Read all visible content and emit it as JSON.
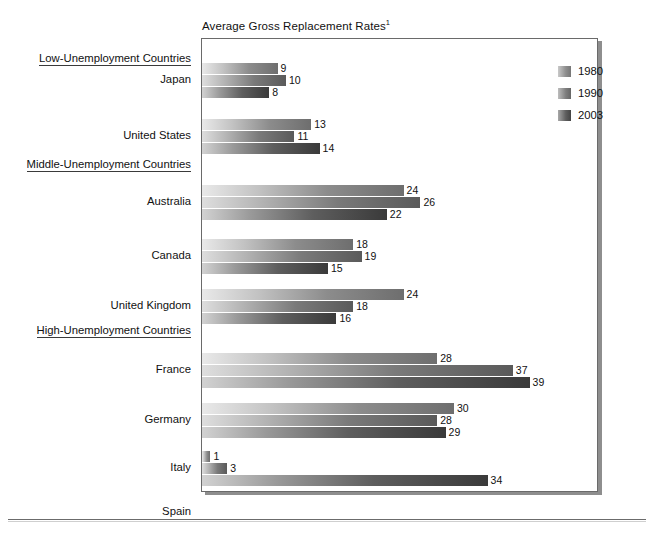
{
  "chart_title": "Average Gross Replacement Rates",
  "chart_title_superscript": "1",
  "legend": {
    "items": [
      {
        "label": "1980",
        "swatch": "series-swatch-1980"
      },
      {
        "label": "1990",
        "swatch": "series-swatch-1990"
      },
      {
        "label": "2003",
        "swatch": "series-swatch-2003"
      }
    ]
  },
  "groups": [
    {
      "label": "Low-Unemployment Countries"
    },
    {
      "label": "Middle-Unemployment Countries"
    },
    {
      "label": "High-Unemployment Countries"
    }
  ],
  "chart_data": {
    "type": "bar",
    "orientation": "horizontal",
    "xlabel": "",
    "ylabel": "",
    "grid": false,
    "legend_position": "top-right",
    "series": [
      {
        "name": "1980",
        "values": [
          9,
          13,
          24,
          18,
          24,
          28,
          30,
          1,
          25
        ]
      },
      {
        "name": "1990",
        "values": [
          10,
          11,
          26,
          19,
          18,
          37,
          28,
          3,
          34
        ]
      },
      {
        "name": "2003",
        "values": [
          8,
          14,
          22,
          15,
          16,
          39,
          29,
          34,
          36
        ]
      }
    ],
    "categories": [
      "Japan",
      "United States",
      "Australia",
      "Canada",
      "United Kingdom",
      "France",
      "Germany",
      "Italy",
      "Spain"
    ],
    "category_groups": [
      {
        "label": "Low-Unemployment Countries",
        "categories": [
          "Japan",
          "United States"
        ]
      },
      {
        "label": "Middle-Unemployment Countries",
        "categories": [
          "Australia",
          "Canada",
          "United Kingdom"
        ]
      },
      {
        "label": "High-Unemployment Countries",
        "categories": [
          "France",
          "Germany",
          "Italy",
          "Spain"
        ]
      }
    ],
    "xlim": [
      0,
      42
    ],
    "rows": [
      {
        "category": "Japan",
        "group": "Low-Unemployment Countries",
        "values": {
          "1980": 9,
          "1990": 10,
          "2003": 8
        }
      },
      {
        "category": "United States",
        "group": "Low-Unemployment Countries",
        "values": {
          "1980": 13,
          "1990": 11,
          "2003": 14
        }
      },
      {
        "category": "Australia",
        "group": "Middle-Unemployment Countries",
        "values": {
          "1980": 24,
          "1990": 26,
          "2003": 22
        }
      },
      {
        "category": "Canada",
        "group": "Middle-Unemployment Countries",
        "values": {
          "1980": 18,
          "1990": 19,
          "2003": 15
        }
      },
      {
        "category": "United Kingdom",
        "group": "Middle-Unemployment Countries",
        "values": {
          "1980": 24,
          "1990": 18,
          "2003": 16
        }
      },
      {
        "category": "France",
        "group": "High-Unemployment Countries",
        "values": {
          "1980": 28,
          "1990": 37,
          "2003": 39
        }
      },
      {
        "category": "Germany",
        "group": "High-Unemployment Countries",
        "values": {
          "1980": 30,
          "1990": 28,
          "2003": 29
        }
      },
      {
        "category": "Italy",
        "group": "High-Unemployment Countries",
        "values": {
          "1980": 1,
          "1990": 3,
          "2003": 34
        }
      },
      {
        "category": "Spain",
        "group": "High-Unemployment Countries",
        "values": {
          "1980": 25,
          "1990": 34,
          "2003": 36
        }
      }
    ]
  },
  "layout": {
    "px_per_unit": 8.4,
    "plot_left": 201,
    "plot_top": 38,
    "plot_width": 397,
    "plot_height": 454,
    "bar_height": 11,
    "bar_gap": 1,
    "group_label_tops": [
      14,
      120,
      286
    ],
    "row_tops": [
      24,
      80,
      146,
      200,
      250,
      314,
      364,
      412,
      456
    ]
  },
  "colors": {
    "series_1980": "#8c8c8c",
    "series_1990": "#7a7a7a",
    "series_2003": "#4a4a4a",
    "frame": "#6a6a6a",
    "text": "#111111",
    "background": "#ffffff"
  }
}
